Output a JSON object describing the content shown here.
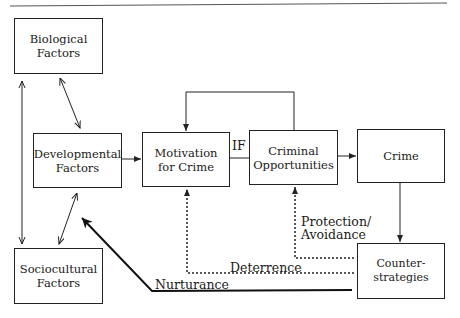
{
  "diagram": {
    "nodes": [
      {
        "id": "biological",
        "label": "Biological\nFactors"
      },
      {
        "id": "developmental",
        "label": "Developmental\nFactors"
      },
      {
        "id": "sociocultural",
        "label": "Sociocultural\nFactors"
      },
      {
        "id": "motivation",
        "label": "Motivation\nfor Crime"
      },
      {
        "id": "opportunities",
        "label": "Criminal\nOpportunities"
      },
      {
        "id": "crime",
        "label": "Crime"
      },
      {
        "id": "counter",
        "label": "Counter-\nstrategies"
      }
    ],
    "edge_labels": {
      "if": "IF",
      "protection": "Protection/\nAvoidance",
      "deterrence": "Deterrence",
      "nurturance": "Nurturance"
    },
    "edges": [
      {
        "from": "biological",
        "to": "developmental",
        "style": "solid",
        "direction": "both"
      },
      {
        "from": "biological",
        "to": "sociocultural",
        "style": "solid",
        "direction": "both"
      },
      {
        "from": "developmental",
        "to": "sociocultural",
        "style": "solid",
        "direction": "both"
      },
      {
        "from": "developmental",
        "to": "motivation",
        "style": "solid",
        "direction": "forward"
      },
      {
        "from": "motivation",
        "to": "opportunities",
        "style": "solid",
        "label": "IF",
        "direction": "none"
      },
      {
        "from": "opportunities",
        "to": "motivation",
        "style": "solid",
        "direction": "forward",
        "route": "loop-over-top"
      },
      {
        "from": "opportunities",
        "to": "crime",
        "style": "solid",
        "direction": "forward"
      },
      {
        "from": "crime",
        "to": "counter",
        "style": "solid",
        "direction": "forward"
      },
      {
        "from": "counter",
        "to": "opportunities",
        "style": "dotted",
        "label": "Protection/Avoidance",
        "direction": "forward"
      },
      {
        "from": "counter",
        "to": "motivation",
        "style": "dotted",
        "label": "Deterrence",
        "direction": "forward"
      },
      {
        "from": "counter",
        "to": "developmental",
        "style": "bold",
        "label": "Nurturance",
        "direction": "forward"
      }
    ]
  }
}
